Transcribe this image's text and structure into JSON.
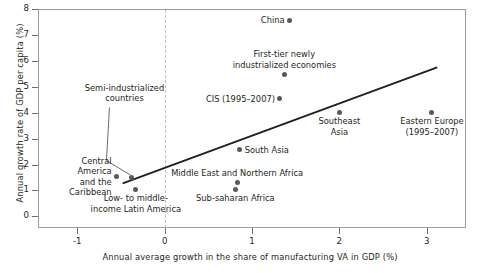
{
  "chart_data": {
    "type": "scatter",
    "title": "",
    "xlabel": "Annual average growth in the share of manufacturing VA in GDP (%)",
    "ylabel": "Annual growth rate of GDP per capita (%)",
    "xlim": [
      -1.45,
      3.45
    ],
    "ylim": [
      -0.45,
      8.0
    ],
    "xticks": [
      -1,
      0,
      1,
      2,
      3
    ],
    "xtick_labels": [
      "-1",
      "0",
      "1",
      "2",
      "3"
    ],
    "yticks": [
      0,
      1,
      2,
      3,
      4,
      5,
      6,
      7,
      8
    ],
    "ytick_labels": [
      "0",
      "1",
      "2",
      "3",
      "4",
      "5",
      "6",
      "7",
      "8"
    ],
    "grid": false,
    "legend": "none",
    "zero_reference_line": {
      "x": 0,
      "style": "dashed",
      "color": "#bcbec0"
    },
    "trendline": {
      "type": "linear",
      "color": "#231f20",
      "x_start": -0.48,
      "y_start": 1.27,
      "x_end": 3.12,
      "y_end": 5.75
    },
    "points": [
      {
        "label": "China",
        "x": 1.43,
        "y": 7.57,
        "label_pos": "left"
      },
      {
        "label": "First-tier newly\nindustrialized economies",
        "x": 1.37,
        "y": 5.48,
        "label_pos": "above"
      },
      {
        "label": "CIS (1995–2007)",
        "x": 1.32,
        "y": 4.55,
        "label_pos": "left"
      },
      {
        "label": "Southeast\nAsia",
        "x": 2.0,
        "y": 4.02,
        "label_pos": "below"
      },
      {
        "label": "Eastern Europe\n(1995–2007)",
        "x": 3.06,
        "y": 4.01,
        "label_pos": "below"
      },
      {
        "label": "South Asia",
        "x": 0.86,
        "y": 2.56,
        "label_pos": "right"
      },
      {
        "label": "Middle East and Northern Africa",
        "x": 0.83,
        "y": 1.32,
        "label_pos": "above"
      },
      {
        "label": "Sub-saharan Africa",
        "x": 0.81,
        "y": 1.05,
        "label_pos": "below"
      },
      {
        "label": "Central\nAmerica\nand the\nCaribbean",
        "x": -0.55,
        "y": 1.54,
        "label_pos": "left"
      },
      {
        "label": "Semi-industrialized\ncountries",
        "x": -0.38,
        "y": 1.48,
        "label_pos": "callout-above"
      },
      {
        "label": "Low- to middle-\nincome Latin America",
        "x": -0.33,
        "y": 1.05,
        "label_pos": "below"
      }
    ],
    "callout": {
      "from_label": "Semi-industrialized countries",
      "leader_line": true,
      "color": "#58595b"
    }
  }
}
